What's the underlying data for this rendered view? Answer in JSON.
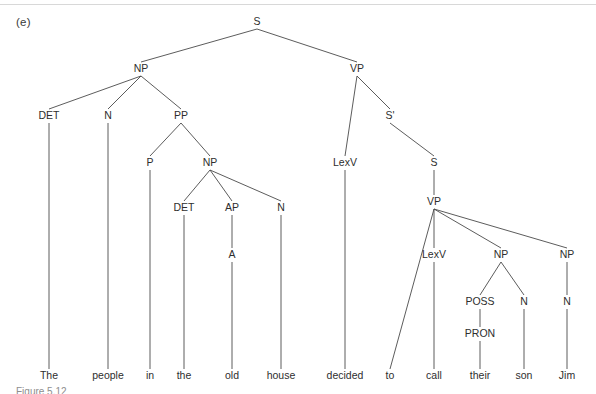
{
  "figure": {
    "item_label": "(e)",
    "caption": "Figure 5.12",
    "sentence": "The people in the old house decided to call their son Jim"
  },
  "colors": {
    "edge": "#4a4a4a",
    "text": "#2e2e2e",
    "background": "#ffffff",
    "rule": "#d8d8d8"
  },
  "tree": {
    "type": "syntax-tree",
    "nodes": [
      {
        "id": "S",
        "label": "S",
        "x": 257,
        "y": 25
      },
      {
        "id": "NP1",
        "label": "NP",
        "x": 141,
        "y": 72
      },
      {
        "id": "VP1",
        "label": "VP",
        "x": 357,
        "y": 72
      },
      {
        "id": "DET1",
        "label": "DET",
        "x": 49,
        "y": 119
      },
      {
        "id": "N1",
        "label": "N",
        "x": 108,
        "y": 119
      },
      {
        "id": "PP",
        "label": "PP",
        "x": 181,
        "y": 119
      },
      {
        "id": "SBAR",
        "label": "S'",
        "x": 390,
        "y": 119
      },
      {
        "id": "P",
        "label": "P",
        "x": 150,
        "y": 166
      },
      {
        "id": "NP2",
        "label": "NP",
        "x": 210,
        "y": 166
      },
      {
        "id": "LEXV1",
        "label": "LexV",
        "x": 345,
        "y": 166
      },
      {
        "id": "S2",
        "label": "S",
        "x": 434,
        "y": 166
      },
      {
        "id": "DET2",
        "label": "DET",
        "x": 184,
        "y": 211
      },
      {
        "id": "AP",
        "label": "AP",
        "x": 232,
        "y": 211
      },
      {
        "id": "N2",
        "label": "N",
        "x": 281,
        "y": 211
      },
      {
        "id": "VP2",
        "label": "VP",
        "x": 434,
        "y": 205
      },
      {
        "id": "A",
        "label": "A",
        "x": 232,
        "y": 258
      },
      {
        "id": "LEXV2",
        "label": "LexV",
        "x": 434,
        "y": 258
      },
      {
        "id": "NP3",
        "label": "NP",
        "x": 501,
        "y": 258
      },
      {
        "id": "NP4",
        "label": "NP",
        "x": 567,
        "y": 258
      },
      {
        "id": "POSS",
        "label": "POSS",
        "x": 480,
        "y": 305
      },
      {
        "id": "N3",
        "label": "N",
        "x": 524,
        "y": 305
      },
      {
        "id": "N4",
        "label": "N",
        "x": 567,
        "y": 305
      },
      {
        "id": "PRON",
        "label": "PRON",
        "x": 480,
        "y": 337
      }
    ],
    "words": [
      {
        "id": "W_THE1",
        "label": "The",
        "x": 49,
        "y": 379
      },
      {
        "id": "W_PEOPLE",
        "label": "people",
        "x": 108,
        "y": 379
      },
      {
        "id": "W_IN",
        "label": "in",
        "x": 150,
        "y": 379
      },
      {
        "id": "W_THE2",
        "label": "the",
        "x": 184,
        "y": 379
      },
      {
        "id": "W_OLD",
        "label": "old",
        "x": 232,
        "y": 379
      },
      {
        "id": "W_HOUSE",
        "label": "house",
        "x": 281,
        "y": 379
      },
      {
        "id": "W_DECIDED",
        "label": "decided",
        "x": 345,
        "y": 379
      },
      {
        "id": "W_TO",
        "label": "to",
        "x": 390,
        "y": 379
      },
      {
        "id": "W_CALL",
        "label": "call",
        "x": 434,
        "y": 379
      },
      {
        "id": "W_THEIR",
        "label": "their",
        "x": 480,
        "y": 379
      },
      {
        "id": "W_SON",
        "label": "son",
        "x": 524,
        "y": 379
      },
      {
        "id": "W_JIM",
        "label": "Jim",
        "x": 567,
        "y": 379
      }
    ],
    "edges": [
      {
        "from": "S",
        "to": "NP1"
      },
      {
        "from": "S",
        "to": "VP1"
      },
      {
        "from": "NP1",
        "to": "DET1"
      },
      {
        "from": "NP1",
        "to": "N1"
      },
      {
        "from": "NP1",
        "to": "PP"
      },
      {
        "from": "VP1",
        "to": "LEXV1"
      },
      {
        "from": "VP1",
        "to": "SBAR"
      },
      {
        "from": "SBAR",
        "to": "S2"
      },
      {
        "from": "PP",
        "to": "P"
      },
      {
        "from": "PP",
        "to": "NP2"
      },
      {
        "from": "NP2",
        "to": "DET2"
      },
      {
        "from": "NP2",
        "to": "AP"
      },
      {
        "from": "NP2",
        "to": "N2"
      },
      {
        "from": "S2",
        "to": "VP2"
      },
      {
        "from": "AP",
        "to": "A"
      },
      {
        "from": "VP2",
        "to": "W_TO"
      },
      {
        "from": "VP2",
        "to": "LEXV2"
      },
      {
        "from": "VP2",
        "to": "NP3"
      },
      {
        "from": "VP2",
        "to": "NP4"
      },
      {
        "from": "NP3",
        "to": "POSS"
      },
      {
        "from": "NP3",
        "to": "N3"
      },
      {
        "from": "NP4",
        "to": "N4"
      },
      {
        "from": "POSS",
        "to": "PRON"
      },
      {
        "from": "DET1",
        "to": "W_THE1"
      },
      {
        "from": "N1",
        "to": "W_PEOPLE"
      },
      {
        "from": "P",
        "to": "W_IN"
      },
      {
        "from": "DET2",
        "to": "W_THE2"
      },
      {
        "from": "A",
        "to": "W_OLD"
      },
      {
        "from": "N2",
        "to": "W_HOUSE"
      },
      {
        "from": "LEXV1",
        "to": "W_DECIDED"
      },
      {
        "from": "LEXV2",
        "to": "W_CALL"
      },
      {
        "from": "PRON",
        "to": "W_THEIR"
      },
      {
        "from": "N3",
        "to": "W_SON"
      },
      {
        "from": "N4",
        "to": "W_JIM"
      }
    ]
  }
}
